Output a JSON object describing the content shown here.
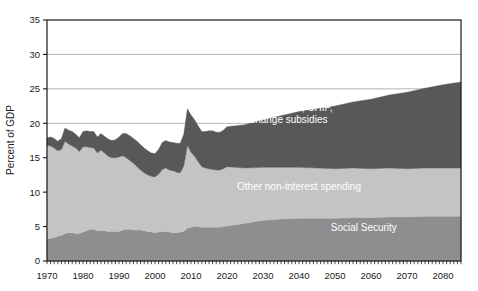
{
  "chart_data": {
    "type": "area",
    "stacked": true,
    "title": "",
    "subtitle": "",
    "xlabel": "",
    "ylabel": "Percent of GDP",
    "xlim": [
      1970,
      2085
    ],
    "ylim": [
      0,
      35
    ],
    "ytick_values": [
      0,
      5,
      10,
      15,
      20,
      25,
      30,
      35
    ],
    "ytick_labels": [
      "0",
      "5",
      "10",
      "15",
      "20",
      "25",
      "30",
      "35"
    ],
    "xtick_values": [
      1970,
      1980,
      1990,
      2000,
      2010,
      2020,
      2030,
      2040,
      2050,
      2060,
      2070,
      2080
    ],
    "xtick_labels": [
      "1970",
      "1980",
      "1990",
      "2000",
      "2010",
      "2020",
      "2030",
      "2040",
      "2050",
      "2060",
      "2070",
      "2080"
    ],
    "gridlines": {
      "visible": true,
      "y_values": [
        20,
        25,
        30
      ],
      "color": "#aaaaaa"
    },
    "minor_xticks": {
      "visible": true,
      "interval": 1
    },
    "legend": {
      "position": "inline-annotations"
    },
    "colors": {
      "social_security": "#8e8e90",
      "other_non_interest_spending": "#c4c4c4",
      "medicare_medicaid_chip": "#58585a",
      "axis": "#1a1a1a",
      "grid": "#aaaaaa",
      "plot_background": "#ffffff"
    },
    "annotations": [
      {
        "text_line1": "Medicare, Medicaid, CHIP,",
        "text_line2": "and exchange subsidies",
        "x": 2033,
        "y": 21.8,
        "color": "#ffffff"
      },
      {
        "text_line1": "Other non-interest spending",
        "text_line2": "",
        "x": 2040,
        "y": 10.3,
        "color": "#ffffff"
      },
      {
        "text_line1": "Social Security",
        "text_line2": "",
        "x": 2058,
        "y": 4.3,
        "color": "#ffffff"
      }
    ],
    "x": [
      1970,
      1971,
      1972,
      1973,
      1974,
      1975,
      1976,
      1977,
      1978,
      1979,
      1980,
      1981,
      1982,
      1983,
      1984,
      1985,
      1986,
      1987,
      1988,
      1989,
      1990,
      1991,
      1992,
      1993,
      1994,
      1995,
      1996,
      1997,
      1998,
      1999,
      2000,
      2001,
      2002,
      2003,
      2004,
      2005,
      2006,
      2007,
      2008,
      2009,
      2010,
      2011,
      2012,
      2013,
      2014,
      2015,
      2016,
      2017,
      2018,
      2019,
      2020,
      2025,
      2030,
      2035,
      2040,
      2045,
      2050,
      2055,
      2060,
      2065,
      2070,
      2075,
      2080,
      2085
    ],
    "series": [
      {
        "name": "Social Security",
        "key": "social_security",
        "color": "#8e8e90",
        "values": [
          3.2,
          3.3,
          3.4,
          3.6,
          3.7,
          4.0,
          4.1,
          4.1,
          4.0,
          4.0,
          4.2,
          4.4,
          4.6,
          4.6,
          4.4,
          4.4,
          4.4,
          4.3,
          4.3,
          4.3,
          4.3,
          4.5,
          4.6,
          4.6,
          4.5,
          4.5,
          4.5,
          4.4,
          4.3,
          4.2,
          4.1,
          4.2,
          4.3,
          4.3,
          4.2,
          4.1,
          4.1,
          4.2,
          4.3,
          4.8,
          4.9,
          5.0,
          5.0,
          4.9,
          4.9,
          4.9,
          4.9,
          4.9,
          4.9,
          5.0,
          5.1,
          5.5,
          5.9,
          6.1,
          6.2,
          6.2,
          6.2,
          6.3,
          6.3,
          6.4,
          6.4,
          6.5,
          6.5,
          6.5
        ]
      },
      {
        "name": "Other non-interest spending",
        "key": "other_non_interest_spending",
        "color": "#c4c4c4",
        "values": [
          13.6,
          13.4,
          13.0,
          12.4,
          12.5,
          13.4,
          12.9,
          12.6,
          12.4,
          11.9,
          12.4,
          12.2,
          11.9,
          11.8,
          11.3,
          11.7,
          11.3,
          10.9,
          10.7,
          10.7,
          10.8,
          10.8,
          10.4,
          10.0,
          9.7,
          9.2,
          8.7,
          8.4,
          8.2,
          8.1,
          8.1,
          8.4,
          9.0,
          9.2,
          9.0,
          9.0,
          8.8,
          8.6,
          9.5,
          12.0,
          10.9,
          10.2,
          9.4,
          8.8,
          8.6,
          8.5,
          8.4,
          8.3,
          8.3,
          8.4,
          8.6,
          8.0,
          7.7,
          7.5,
          7.4,
          7.3,
          7.2,
          7.2,
          7.1,
          7.1,
          7.0,
          7.0,
          7.0,
          7.0
        ]
      },
      {
        "name": "Medicare, Medicaid, CHIP, and exchange subsidies",
        "key": "medicare_medicaid_chip",
        "color": "#58585a",
        "values": [
          1.1,
          1.3,
          1.4,
          1.4,
          1.6,
          1.9,
          2.0,
          2.1,
          2.0,
          2.0,
          2.2,
          2.3,
          2.3,
          2.4,
          2.3,
          2.4,
          2.4,
          2.5,
          2.5,
          2.6,
          2.9,
          3.2,
          3.5,
          3.6,
          3.6,
          3.7,
          3.7,
          3.6,
          3.5,
          3.4,
          3.4,
          3.6,
          3.9,
          4.0,
          4.1,
          4.1,
          4.2,
          4.3,
          4.6,
          5.3,
          5.4,
          5.3,
          5.2,
          5.1,
          5.3,
          5.5,
          5.6,
          5.5,
          5.5,
          5.6,
          5.8,
          6.3,
          6.9,
          7.5,
          8.1,
          8.6,
          9.1,
          9.6,
          10.1,
          10.6,
          11.1,
          11.6,
          12.1,
          12.5
        ]
      }
    ],
    "historical_projection_boundary": 2019,
    "total_at_start": 17.9,
    "total_peak_2009": 24.1,
    "total_at_end": 26.0
  }
}
